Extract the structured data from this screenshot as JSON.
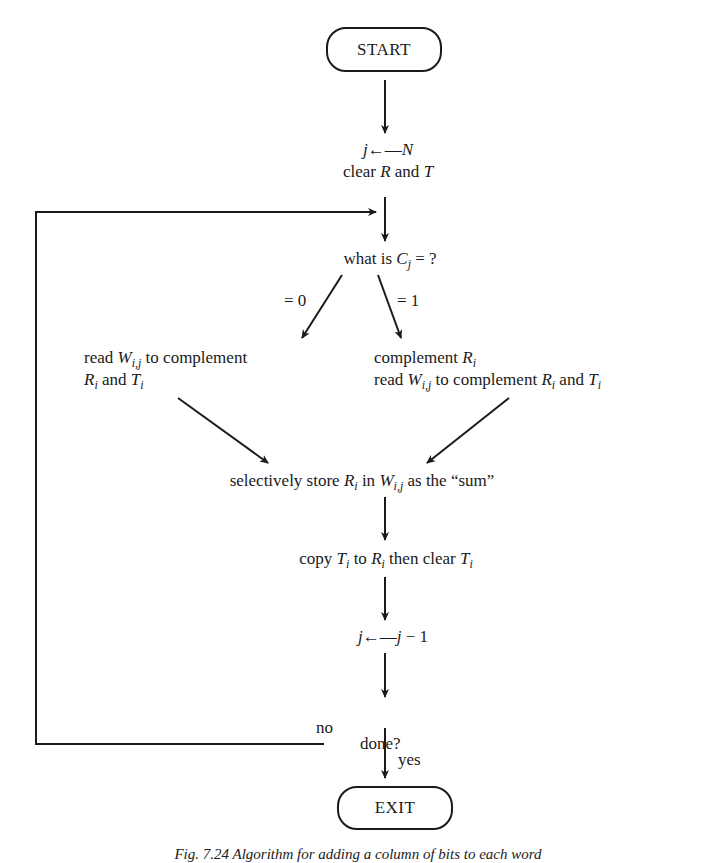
{
  "diagram": {
    "type": "flowchart",
    "nodes": {
      "start": {
        "label": "START",
        "shape": "terminal"
      },
      "init_1": {
        "var": "j",
        "arrow": "←",
        "value": "N"
      },
      "init_2": {
        "pre": "clear ",
        "R": "R",
        "mid": " and ",
        "T": "T"
      },
      "decision": {
        "pre": "what is ",
        "var": "C",
        "sub": "j",
        "post": " = ?"
      },
      "branch_zero_label": "= 0",
      "branch_one_label": "= 1",
      "left_action": {
        "line1_pre": "read ",
        "line1_var": "W",
        "line1_sub": "i,j",
        "line1_post": " to complement",
        "line2_var1": "R",
        "line2_sub1": "i",
        "line2_mid": " and ",
        "line2_var2": "T",
        "line2_sub2": "i"
      },
      "right_action": {
        "line1_pre": "complement ",
        "line1_var": "R",
        "line1_sub": "i",
        "line2_pre": "read ",
        "line2_var": "W",
        "line2_sub": "i,j",
        "line2_mid": " to complement ",
        "line2_var2": "R",
        "line2_sub2": "i",
        "line2_mid2": " and ",
        "line2_var3": "T",
        "line2_sub3": "i"
      },
      "store": {
        "pre": "selectively store ",
        "var1": "R",
        "sub1": "i",
        "mid": " in ",
        "var2": "W",
        "sub2": "i,j",
        "post": " as the “sum”"
      },
      "copy": {
        "pre": "copy ",
        "var1": "T",
        "sub1": "i",
        "mid": " to ",
        "var2": "R",
        "sub2": "i",
        "mid2": " then clear ",
        "var3": "T",
        "sub3": "i"
      },
      "decrement": {
        "var": "j",
        "arrow": "←",
        "value_var": "j",
        "value_rest": " − 1"
      },
      "done": {
        "label": "done?"
      },
      "no_label": "no",
      "yes_label": "yes",
      "exit": {
        "label": "EXIT",
        "shape": "terminal"
      }
    },
    "edges": [
      [
        "start",
        "init"
      ],
      [
        "init",
        "decision"
      ],
      [
        "decision",
        "left_action",
        "= 0"
      ],
      [
        "decision",
        "right_action",
        "= 1"
      ],
      [
        "left_action",
        "store"
      ],
      [
        "right_action",
        "store"
      ],
      [
        "store",
        "copy"
      ],
      [
        "copy",
        "decrement"
      ],
      [
        "decrement",
        "done"
      ],
      [
        "done",
        "decision",
        "no"
      ],
      [
        "done",
        "exit",
        "yes"
      ]
    ],
    "caption": "Fig. 7.24  Algorithm for adding a column of bits to each word"
  }
}
